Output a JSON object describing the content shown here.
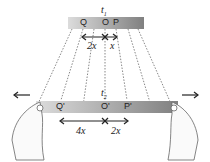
{
  "diagram": {
    "top_ruler": {
      "time_label": "t",
      "time_sub": "1",
      "marks": [
        "Q",
        "O",
        "P"
      ],
      "left_span": "2x",
      "right_span": "x"
    },
    "bottom_ruler": {
      "time_label": "t",
      "time_sub": "2",
      "marks": [
        "Q'",
        "O'",
        "P'"
      ],
      "left_span": "4x",
      "right_span": "2x"
    },
    "arrows": {
      "left": "←",
      "right": "→"
    },
    "colors": {
      "ruler_light": "#d8d8d8",
      "ruler_dark": "#7a7a7a",
      "line": "#333333"
    }
  }
}
